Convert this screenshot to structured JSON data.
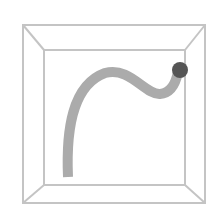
{
  "scene": {
    "description": "Perspective view of an open box (room) with a curved tube ending in a sphere",
    "colors": {
      "background": "#ffffff",
      "box_edge": "#c4c4c4",
      "tube": "#ababab",
      "ball": "#555555"
    },
    "box": {
      "outer": {
        "x1": 23,
        "y1": 25,
        "x2": 205,
        "y2": 203
      },
      "inner": {
        "x1": 44,
        "y1": 50,
        "x2": 185,
        "y2": 185
      }
    },
    "tube": {
      "width": 10,
      "path": "M 68 177 C 66 130, 72 85, 105 73 C 130 66, 145 95, 160 94 C 172 93, 176 82, 178 72"
    },
    "ball": {
      "cx": 180,
      "cy": 70,
      "r": 8
    }
  }
}
